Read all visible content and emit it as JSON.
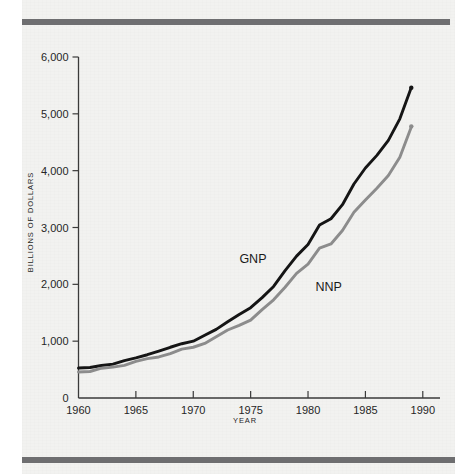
{
  "figure": {
    "background_color": "#f2f2f0",
    "rule_color": "#6e6e70",
    "top_rule_name": "top-rule",
    "bottom_rule_name": "bottom-rule"
  },
  "chart_data": {
    "type": "line",
    "title": "",
    "subtitle": "",
    "xlabel": "YEAR",
    "ylabel": "BILLIONS OF DOLLARS",
    "xlim": [
      1960,
      1991.5
    ],
    "ylim": [
      0,
      6000
    ],
    "grid": false,
    "legend_position": "inline-annotations",
    "xticks": [
      1960,
      1965,
      1970,
      1975,
      1980,
      1985,
      1990
    ],
    "xtick_labels": [
      "1960",
      "1965",
      "1970",
      "1975",
      "1980",
      "1985",
      "1990"
    ],
    "yticks": [
      0,
      1000,
      2000,
      3000,
      4000,
      5000,
      6000
    ],
    "ytick_labels": [
      "0",
      "1,000",
      "2,000",
      "3,000",
      "4,000",
      "5,000",
      "6,000"
    ],
    "x": [
      1960,
      1961,
      1962,
      1963,
      1964,
      1965,
      1966,
      1967,
      1968,
      1969,
      1970,
      1971,
      1972,
      1973,
      1974,
      1975,
      1976,
      1977,
      1978,
      1979,
      1980,
      1981,
      1982,
      1983,
      1984,
      1985,
      1986,
      1987,
      1988,
      1989
    ],
    "series": [
      {
        "name": "GNP",
        "color": "#151515",
        "label": "GNP",
        "label_x": 1975.2,
        "label_y": 2380,
        "values": [
          515,
          533,
          575,
          607,
          650,
          706,
          769,
          814,
          889,
          959,
          1011,
          1098,
          1207,
          1350,
          1459,
          1586,
          1770,
          1974,
          2233,
          2496,
          2708,
          3031,
          3150,
          3405,
          3777,
          4039,
          4269,
          4540,
          4900,
          5460
        ]
      },
      {
        "name": "NNP",
        "color": "#8c8c8c",
        "label": "NNP",
        "label_x": 1981.8,
        "label_y": 1890,
        "values": [
          462,
          478,
          516,
          544,
          582,
          633,
          689,
          726,
          792,
          851,
          893,
          968,
          1065,
          1192,
          1282,
          1381,
          1548,
          1727,
          1956,
          2181,
          2351,
          2640,
          2722,
          2940,
          3268,
          3492,
          3680,
          3910,
          4240,
          4780
        ]
      }
    ]
  }
}
